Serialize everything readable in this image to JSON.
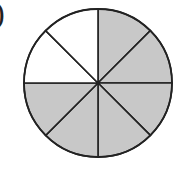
{
  "label": {
    "text": ")"
  },
  "diagram": {
    "type": "fraction-circle",
    "slices_total": 8,
    "slices_shaded": 6,
    "slices_unshaded": 2,
    "shaded_color": "#c8c8c8",
    "unshaded_color": "#ffffff",
    "stroke_color": "#222222",
    "fraction_shaded": "6/8",
    "center": [
      98,
      83
    ],
    "radius": 74
  }
}
